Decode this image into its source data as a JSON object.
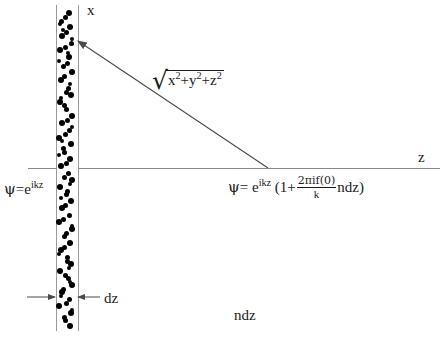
{
  "figure": {
    "axes": {
      "vertical_label": "x",
      "horizontal_label": "z"
    },
    "labels": {
      "thickness": "dz",
      "areal_density": "ndz"
    },
    "distance_expression": {
      "radical_symbol": "√",
      "terms": [
        "x",
        "y",
        "z"
      ],
      "exponent": "2",
      "plus": "+",
      "full_text": "√(x²+y²+z²)"
    },
    "incident_wave": {
      "psi": "ψ",
      "equals": "=",
      "base": "e",
      "exponent": "ikz",
      "full_text": "ψ = e^{ikz}"
    },
    "scattered_wave": {
      "psi": "ψ",
      "equals": "=",
      "base": "e",
      "exponent": "ikz",
      "open_paren": "(1+",
      "numerator": "2πif(0)",
      "denominator": "k",
      "tail": "ndz)",
      "full_text": "ψ = e^{ikz}(1 + (2πif(0)/k) ndz)"
    },
    "colors": {
      "axis": "#8a8a8a",
      "slab_border": "#9a9a9a",
      "dots": "#000000",
      "ink": "#1a1a1a",
      "background": "#ffffff"
    },
    "slab": {
      "dot_count": 84,
      "dot_positions": [
        [
          12,
          8,
          6
        ],
        [
          4,
          16,
          5
        ],
        [
          13,
          22,
          6
        ],
        [
          5,
          31,
          6
        ],
        [
          14,
          38,
          5
        ],
        [
          3,
          45,
          6
        ],
        [
          12,
          52,
          6
        ],
        [
          6,
          61,
          5
        ],
        [
          15,
          67,
          6
        ],
        [
          4,
          75,
          6
        ],
        [
          11,
          83,
          5
        ],
        [
          14,
          90,
          6
        ],
        [
          3,
          97,
          6
        ],
        [
          9,
          104,
          5
        ],
        [
          15,
          111,
          6
        ],
        [
          5,
          118,
          6
        ],
        [
          12,
          125,
          5
        ],
        [
          2,
          133,
          6
        ],
        [
          14,
          139,
          6
        ],
        [
          7,
          147,
          5
        ],
        [
          13,
          154,
          6
        ],
        [
          4,
          161,
          6
        ],
        [
          11,
          168,
          5
        ],
        [
          15,
          175,
          6
        ],
        [
          3,
          182,
          6
        ],
        [
          9,
          189,
          5
        ],
        [
          14,
          196,
          6
        ],
        [
          5,
          203,
          6
        ],
        [
          12,
          210,
          5
        ],
        [
          2,
          217,
          6
        ],
        [
          15,
          224,
          6
        ],
        [
          7,
          231,
          5
        ],
        [
          13,
          238,
          6
        ],
        [
          4,
          245,
          6
        ],
        [
          10,
          252,
          5
        ],
        [
          14,
          259,
          6
        ],
        [
          3,
          266,
          6
        ],
        [
          11,
          273,
          5
        ],
        [
          15,
          280,
          6
        ],
        [
          5,
          287,
          6
        ],
        [
          12,
          294,
          5
        ],
        [
          2,
          301,
          6
        ],
        [
          14,
          308,
          6
        ],
        [
          8,
          315,
          5
        ],
        [
          13,
          321,
          6
        ],
        [
          8,
          12,
          5
        ],
        [
          9,
          27,
          5
        ],
        [
          8,
          42,
          5
        ],
        [
          10,
          58,
          5
        ],
        [
          7,
          71,
          5
        ],
        [
          9,
          87,
          5
        ],
        [
          7,
          100,
          5
        ],
        [
          10,
          115,
          5
        ],
        [
          8,
          129,
          5
        ],
        [
          6,
          143,
          5
        ],
        [
          9,
          158,
          5
        ],
        [
          7,
          172,
          5
        ],
        [
          10,
          186,
          5
        ],
        [
          8,
          200,
          5
        ],
        [
          6,
          214,
          5
        ],
        [
          9,
          228,
          5
        ],
        [
          7,
          242,
          5
        ],
        [
          10,
          256,
          5
        ],
        [
          8,
          270,
          5
        ],
        [
          6,
          284,
          5
        ],
        [
          9,
          298,
          5
        ],
        [
          7,
          312,
          5
        ],
        [
          3,
          19,
          4
        ],
        [
          15,
          34,
          4
        ],
        [
          2,
          56,
          4
        ],
        [
          13,
          79,
          4
        ],
        [
          4,
          93,
          4
        ],
        [
          15,
          122,
          4
        ],
        [
          2,
          150,
          4
        ],
        [
          13,
          179,
          4
        ],
        [
          4,
          193,
          4
        ],
        [
          15,
          221,
          4
        ],
        [
          2,
          249,
          4
        ],
        [
          13,
          277,
          4
        ],
        [
          4,
          291,
          4
        ],
        [
          15,
          305,
          4
        ],
        [
          6,
          25,
          4
        ],
        [
          11,
          48,
          4
        ],
        [
          5,
          136,
          4
        ],
        [
          12,
          263,
          4
        ]
      ]
    }
  }
}
